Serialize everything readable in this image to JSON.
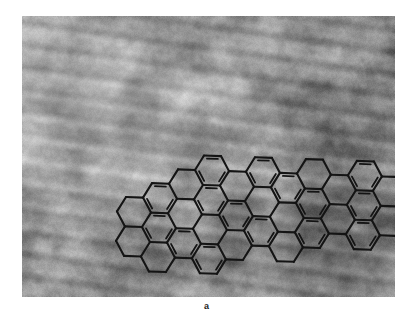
{
  "figure": {
    "panel_label": "a",
    "panel_label_name": "panel-label-a",
    "image_kind": "electron-micrograph",
    "colors": {
      "background_page": "#ffffff",
      "micrograph_mid_gray": "#8d8d8d",
      "micrograph_light_gray": "#d2d2d2",
      "micrograph_dark_gray": "#5a5a5a",
      "overlay_bond_color": "#141414"
    },
    "panel": {
      "x": 22,
      "y": 16,
      "width": 373,
      "height": 281
    }
  },
  "chart_data": {
    "type": "scatter",
    "title": "",
    "xlabel": "",
    "ylabel": "",
    "overlay": {
      "motif": "honeycomb",
      "hex_radius_px": 17,
      "bond_stroke_px": 2.1,
      "double_bond_inset_px": 3.4,
      "rotation_deg": -28,
      "axial_coords": [
        [
          0,
          0
        ],
        [
          1,
          0
        ],
        [
          2,
          0
        ],
        [
          3,
          0
        ],
        [
          -1,
          1
        ],
        [
          0,
          1
        ],
        [
          1,
          1
        ],
        [
          2,
          1
        ],
        [
          3,
          1
        ],
        [
          4,
          1
        ],
        [
          -1,
          2
        ],
        [
          0,
          2
        ],
        [
          1,
          2
        ],
        [
          2,
          2
        ],
        [
          3,
          2
        ],
        [
          4,
          2
        ],
        [
          5,
          2
        ],
        [
          0,
          3
        ],
        [
          1,
          3
        ],
        [
          2,
          3
        ],
        [
          3,
          3
        ],
        [
          4,
          3
        ],
        [
          5,
          3
        ],
        [
          6,
          3
        ],
        [
          2,
          4
        ],
        [
          3,
          4
        ],
        [
          4,
          4
        ],
        [
          5,
          4
        ],
        [
          6,
          4
        ],
        [
          4,
          5
        ],
        [
          5,
          5
        ],
        [
          6,
          5
        ],
        [
          7,
          5
        ]
      ],
      "aromatic_ring_indices": [
        1,
        3,
        5,
        7,
        9,
        11,
        13,
        15,
        17,
        19,
        21,
        23,
        25,
        27,
        29,
        31
      ]
    },
    "background_texture": {
      "kind": "film-grain-with-lattice-fringes",
      "fringe_orientation_deg": 172,
      "fringe_spacing_px": 21,
      "mean_level": 141,
      "contrast": 0.42
    },
    "layout_hints": {
      "grid": false,
      "legend_position": "none",
      "axes_visible": false
    }
  }
}
